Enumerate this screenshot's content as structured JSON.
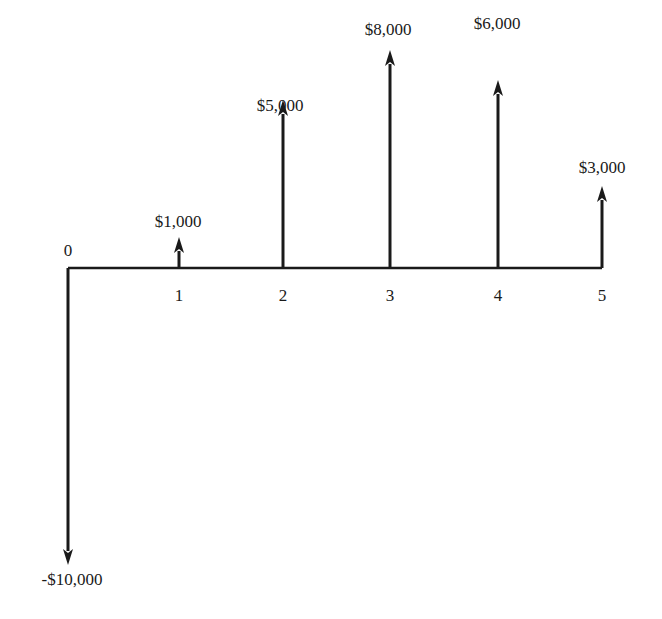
{
  "diagram": {
    "type": "cash-flow-diagram",
    "line_color": "#1a1a1a",
    "axis": {
      "y": 268,
      "x_start": 68,
      "x_end": 602
    },
    "periods": [
      {
        "period": "0",
        "x": 68,
        "cash_flow": -10000,
        "label": "-$10,000",
        "tip_y": 565
      },
      {
        "period": "1",
        "x": 179,
        "cash_flow": 1000,
        "label": "$1,000",
        "tip_y": 237
      },
      {
        "period": "2",
        "x": 283,
        "cash_flow": 5000,
        "label": "$5,000",
        "tip_y": 100
      },
      {
        "period": "3",
        "x": 390,
        "cash_flow": 8000,
        "label": "$8,000",
        "tip_y": 50
      },
      {
        "period": "4",
        "x": 498,
        "cash_flow": 6000,
        "label": "$6,000",
        "tip_y": 80
      },
      {
        "period": "5",
        "x": 602,
        "cash_flow": 3000,
        "label": "$3,000",
        "tip_y": 186
      }
    ]
  },
  "chart_data": {
    "type": "bar",
    "title": "",
    "xlabel": "Period",
    "ylabel": "Cash flow ($)",
    "categories": [
      "0",
      "1",
      "2",
      "3",
      "4",
      "5"
    ],
    "values": [
      -10000,
      1000,
      5000,
      8000,
      6000,
      3000
    ],
    "annotations": [
      "-$10,000",
      "$1,000",
      "$5,000",
      "$8,000",
      "$6,000",
      "$3,000"
    ],
    "grid": false,
    "legend": null
  }
}
